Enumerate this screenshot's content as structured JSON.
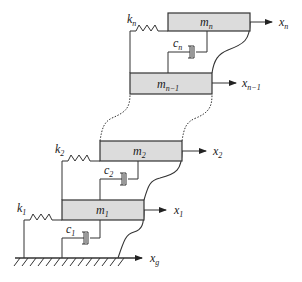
{
  "diagram": {
    "title": "",
    "type": "multi-degree-of-freedom shear building model",
    "colors": {
      "line": "#333333",
      "mass_fill": "#dcdcdc",
      "background": "#ffffff"
    },
    "floors": [
      {
        "mass": {
          "base": "m",
          "sub": "n"
        },
        "spring": {
          "base": "k",
          "sub": "n"
        },
        "damper": {
          "base": "c",
          "sub": "n"
        },
        "displacement": {
          "base": "x",
          "sub": "n"
        }
      },
      {
        "mass": {
          "base": "m",
          "sub": "n−1"
        },
        "displacement": {
          "base": "x",
          "sub": "n−1"
        }
      },
      {
        "mass": {
          "base": "m",
          "sub": "2"
        },
        "spring": {
          "base": "k",
          "sub": "2"
        },
        "damper": {
          "base": "c",
          "sub": "2"
        },
        "displacement": {
          "base": "x",
          "sub": "2"
        }
      },
      {
        "mass": {
          "base": "m",
          "sub": "1"
        },
        "spring": {
          "base": "k",
          "sub": "1"
        },
        "damper": {
          "base": "c",
          "sub": "1"
        },
        "displacement": {
          "base": "x",
          "sub": "1"
        }
      }
    ],
    "ground": {
      "displacement": {
        "base": "x",
        "sub": "g"
      }
    }
  }
}
